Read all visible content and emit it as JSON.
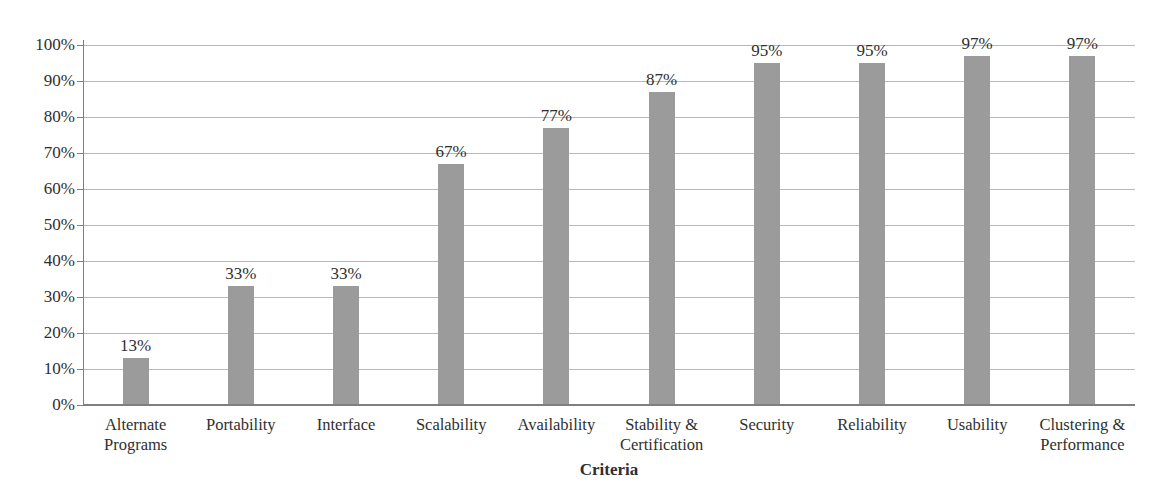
{
  "chart_data": {
    "type": "bar",
    "title": "",
    "xlabel": "Criteria",
    "ylabel": "",
    "categories": [
      "Alternate Programs",
      "Portability",
      "Interface",
      "Scalability",
      "Availability",
      "Stability & Certification",
      "Security",
      "Reliability",
      "Usability",
      "Clustering & Performance"
    ],
    "values": [
      13,
      33,
      33,
      67,
      77,
      87,
      95,
      95,
      97,
      97
    ],
    "value_labels": [
      "13%",
      "33%",
      "33%",
      "67%",
      "77%",
      "87%",
      "95%",
      "95%",
      "97%",
      "97%"
    ],
    "y_tick_values": [
      0,
      10,
      20,
      30,
      40,
      50,
      60,
      70,
      80,
      90,
      100
    ],
    "y_tick_labels": [
      "0%",
      "10%",
      "20%",
      "30%",
      "40%",
      "50%",
      "60%",
      "70%",
      "80%",
      "90%",
      "100%"
    ],
    "ylim": [
      0,
      100
    ],
    "grid": true,
    "legend": "none",
    "bar_color": "#9b9b9b",
    "gridline_color": "#b8b8b8",
    "axis_color": "#7f7f7f",
    "text_color": "#2f2f2f"
  }
}
